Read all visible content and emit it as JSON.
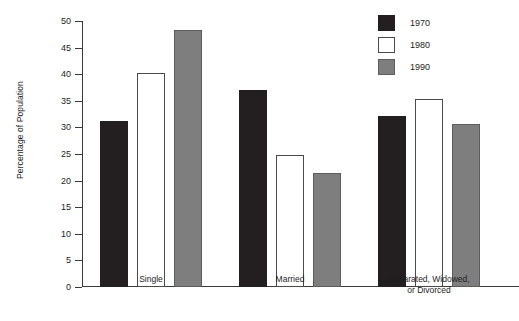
{
  "chart_data": {
    "type": "bar",
    "title": "",
    "subtitle": "",
    "xlabel": "",
    "ylabel": "Percentage of Population",
    "categories": [
      "Single",
      "Married",
      "Separated, Widowed,\nor Divorced"
    ],
    "category_lines": [
      [
        "Single"
      ],
      [
        "Married"
      ],
      [
        "Separated, Widowed,",
        "or Divorced"
      ]
    ],
    "series": [
      {
        "name": "1970",
        "color": "#231f20",
        "values": [
          31.2,
          37.0,
          32.2
        ]
      },
      {
        "name": "1980",
        "color": "#ffffff",
        "values": [
          40.3,
          24.8,
          35.4
        ]
      },
      {
        "name": "1990",
        "color": "#7e7e7e",
        "values": [
          48.4,
          21.5,
          30.6
        ]
      }
    ],
    "ylim": [
      0,
      50
    ],
    "yticks": [
      0,
      5,
      10,
      15,
      20,
      25,
      30,
      35,
      40,
      45,
      50
    ],
    "ytick_labels": [
      "0",
      "5",
      "10",
      "15",
      "20",
      "25",
      "30",
      "35",
      "40",
      "45",
      "50"
    ],
    "grid": false,
    "legend_position": "top-right",
    "legend": [
      {
        "label": "1970",
        "color": "#231f20"
      },
      {
        "label": "1980",
        "color": "#ffffff"
      },
      {
        "label": "1990",
        "color": "#7e7e7e"
      }
    ]
  }
}
